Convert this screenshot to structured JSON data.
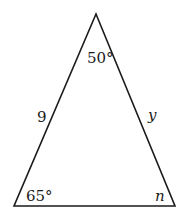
{
  "diagram": {
    "type": "triangle",
    "vertices": {
      "apex": {
        "x": 96,
        "y": 14
      },
      "bottom_left": {
        "x": 14,
        "y": 206
      },
      "bottom_right": {
        "x": 175,
        "y": 206
      }
    },
    "angles": {
      "apex": "50°",
      "bottom_left": "65°",
      "bottom_right": "n"
    },
    "sides": {
      "left": "9",
      "right": "y"
    },
    "stroke_color": "#1a1a1a",
    "background": "#ffffff"
  }
}
